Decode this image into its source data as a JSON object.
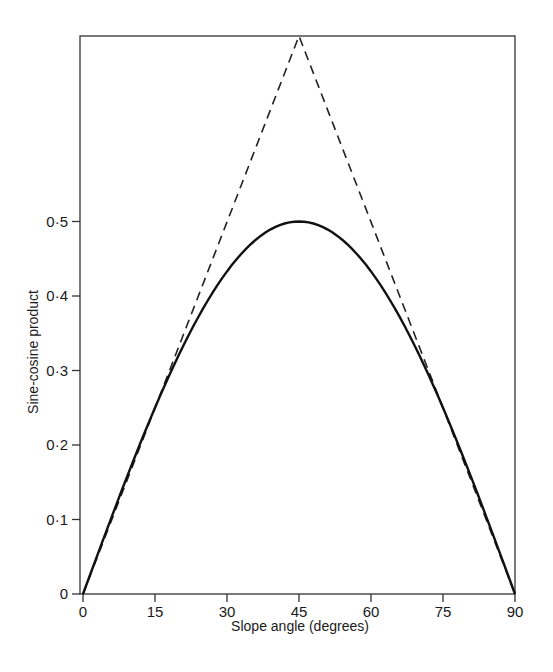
{
  "chart_data": {
    "type": "line",
    "title": "",
    "xlabel": "Slope angle (degrees)",
    "ylabel": "Sine-cosine product",
    "xlim": [
      0,
      90
    ],
    "ylim": [
      0,
      1.0
    ],
    "grid": false,
    "legend": null,
    "x_ticks": [
      0,
      15,
      30,
      45,
      60,
      75,
      90
    ],
    "x_tick_labels": [
      "0",
      "15",
      "30",
      "45",
      "60",
      "75",
      "90"
    ],
    "y_ticks": [
      0,
      0.1,
      0.2,
      0.3,
      0.4,
      0.5
    ],
    "y_tick_labels": [
      "0",
      "0·1",
      "0·2",
      "0·3",
      "0·4",
      "0·5"
    ],
    "series": [
      {
        "name": "sin·cos product",
        "style": "solid",
        "x": [
          0,
          15,
          30,
          45,
          60,
          75,
          90
        ],
        "values": [
          0,
          0.25,
          0.433,
          0.5,
          0.433,
          0.25,
          0
        ]
      },
      {
        "name": "linear tangent approximation",
        "style": "dashed",
        "x": [
          0,
          45,
          90
        ],
        "values": [
          0,
          0.785,
          0
        ]
      }
    ]
  },
  "labels": {
    "xlabel": "Slope angle (degrees)",
    "ylabel": "Sine-cosine product"
  }
}
